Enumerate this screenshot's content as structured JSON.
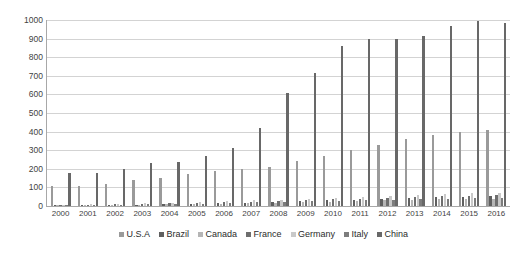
{
  "chart_data": {
    "type": "bar",
    "title": "",
    "xlabel": "",
    "ylabel": "",
    "ylim": [
      0,
      1000
    ],
    "ytick_step": 100,
    "ytick_labels": [
      "1000",
      "900",
      "800",
      "700",
      "600",
      "500",
      "400",
      "300",
      "200",
      "100",
      "0"
    ],
    "grid": "horizontal",
    "legend_position": "bottom-center",
    "categories": [
      "2000",
      "2001",
      "2002",
      "2003",
      "2004",
      "2005",
      "2006",
      "2007",
      "2008",
      "2009",
      "2010",
      "2011",
      "2012",
      "2013",
      "2014",
      "2015",
      "2016"
    ],
    "series": [
      {
        "name": "U.S.A",
        "color": "#9a9a9a",
        "values": [
          110,
          105,
          120,
          140,
          150,
          170,
          190,
          200,
          210,
          240,
          270,
          300,
          330,
          360,
          380,
          400,
          410
        ]
      },
      {
        "name": "Brazil",
        "color": "#5f5f5f",
        "values": [
          5,
          5,
          6,
          8,
          10,
          12,
          15,
          18,
          22,
          26,
          30,
          34,
          38,
          42,
          46,
          50,
          54
        ]
      },
      {
        "name": "Canada",
        "color": "#b5b5b5",
        "values": [
          4,
          5,
          6,
          7,
          9,
          11,
          13,
          15,
          18,
          21,
          24,
          27,
          30,
          33,
          36,
          38,
          40
        ]
      },
      {
        "name": "France",
        "color": "#6e6e6e",
        "values": [
          6,
          7,
          9,
          11,
          14,
          17,
          20,
          24,
          28,
          32,
          36,
          40,
          44,
          48,
          52,
          55,
          58
        ]
      },
      {
        "name": "Germany",
        "color": "#c9c9c9",
        "values": [
          8,
          10,
          12,
          15,
          18,
          22,
          26,
          30,
          35,
          40,
          45,
          50,
          55,
          60,
          65,
          68,
          72
        ]
      },
      {
        "name": "Italy",
        "color": "#7d7d7d",
        "values": [
          5,
          6,
          7,
          9,
          11,
          13,
          16,
          19,
          22,
          25,
          28,
          31,
          34,
          37,
          40,
          42,
          45
        ]
      },
      {
        "name": "China",
        "color": "#686868",
        "values": [
          180,
          175,
          200,
          230,
          235,
          270,
          310,
          420,
          610,
          715,
          860,
          900,
          900,
          915,
          970,
          995,
          985
        ]
      }
    ],
    "secondary_series_note": {
      "usa_secondary": [
        105,
        100,
        115,
        135,
        145,
        165,
        185,
        195,
        200,
        230,
        265,
        295,
        325,
        355,
        375,
        395,
        405
      ]
    }
  },
  "legend": {
    "items": [
      {
        "label": "U.S.A"
      },
      {
        "label": "Brazil"
      },
      {
        "label": "Canada"
      },
      {
        "label": "France"
      },
      {
        "label": "Germany"
      },
      {
        "label": "Italy"
      },
      {
        "label": "China"
      }
    ]
  }
}
